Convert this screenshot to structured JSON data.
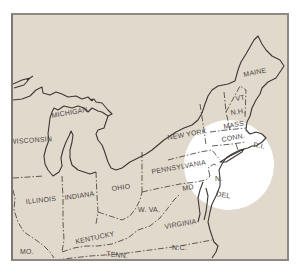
{
  "map": {
    "frame_color": "#e2d9cd",
    "highlight_color": "#ffffff",
    "line_color": "#3c3834",
    "label_color": "#4a4642",
    "highlight": {
      "description": "White circle highlighting the Mid-Atlantic region",
      "center_x": 229,
      "center_y": 165,
      "radius": 45
    },
    "labels": [
      {
        "id": "maine",
        "text": "MAINE",
        "x": 244,
        "y": 77,
        "rotate": -12
      },
      {
        "id": "vt",
        "text": "VT",
        "x": 236,
        "y": 101,
        "rotate": -10
      },
      {
        "id": "nh",
        "text": "N.H.",
        "x": 231,
        "y": 115,
        "rotate": -8
      },
      {
        "id": "mass",
        "text": "MASS.",
        "x": 224,
        "y": 129,
        "rotate": -10
      },
      {
        "id": "conn",
        "text": "CONN.",
        "x": 222,
        "y": 142,
        "rotate": -10
      },
      {
        "id": "ri",
        "text": "R.I.",
        "x": 253,
        "y": 147,
        "rotate": 10
      },
      {
        "id": "new-york",
        "text": "NEW YORK",
        "x": 168,
        "y": 140,
        "rotate": -10
      },
      {
        "id": "michigan",
        "text": "MICHIGAN",
        "x": 52,
        "y": 118,
        "rotate": -10
      },
      {
        "id": "wisconsin",
        "text": "WISCONSIN",
        "x": 10,
        "y": 144,
        "rotate": -4
      },
      {
        "id": "pennsylvania",
        "text": "PENNSYLVANIA",
        "x": 152,
        "y": 174,
        "rotate": -10
      },
      {
        "id": "ohio",
        "text": "OHIO",
        "x": 112,
        "y": 191,
        "rotate": -8
      },
      {
        "id": "indiana",
        "text": "INDIANA",
        "x": 65,
        "y": 200,
        "rotate": -8
      },
      {
        "id": "illinois",
        "text": "ILLINOIS",
        "x": 26,
        "y": 204,
        "rotate": -6
      },
      {
        "id": "nj",
        "text": "N.",
        "x": 215,
        "y": 181,
        "rotate": 0
      },
      {
        "id": "md",
        "text": "MD",
        "x": 183,
        "y": 191,
        "rotate": -12
      },
      {
        "id": "del",
        "text": "DEL",
        "x": 216,
        "y": 196,
        "rotate": 10
      },
      {
        "id": "wva",
        "text": "W. VA.",
        "x": 138,
        "y": 212,
        "rotate": 0
      },
      {
        "id": "virginia",
        "text": "VIRGINIA",
        "x": 165,
        "y": 229,
        "rotate": -10
      },
      {
        "id": "kentucky",
        "text": "KENTUCKY",
        "x": 76,
        "y": 244,
        "rotate": -12
      },
      {
        "id": "mo",
        "text": "MO.",
        "x": 20,
        "y": 254,
        "rotate": 0
      },
      {
        "id": "tenn",
        "text": "TENN.",
        "x": 106,
        "y": 256,
        "rotate": 6
      },
      {
        "id": "nc",
        "text": "N.C.",
        "x": 172,
        "y": 250,
        "rotate": 0
      }
    ]
  }
}
